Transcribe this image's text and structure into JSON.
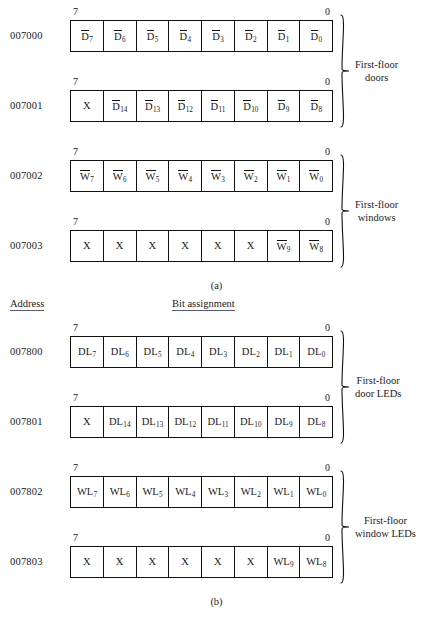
{
  "figures": [
    {
      "id": "a",
      "caption": "(a)",
      "headers": {
        "address": "Address",
        "bits": "Bit assignment"
      },
      "show_headers": false,
      "rows": [
        {
          "address": "007000",
          "msb": "7",
          "lsb": "0",
          "cells": [
            {
              "text": "D",
              "sub": "7",
              "overbar": true
            },
            {
              "text": "D",
              "sub": "6",
              "overbar": true
            },
            {
              "text": "D",
              "sub": "5",
              "overbar": true
            },
            {
              "text": "D",
              "sub": "4",
              "overbar": true
            },
            {
              "text": "D",
              "sub": "3",
              "overbar": true
            },
            {
              "text": "D",
              "sub": "2",
              "overbar": true
            },
            {
              "text": "D",
              "sub": "1",
              "overbar": true
            },
            {
              "text": "D",
              "sub": "0",
              "overbar": true
            }
          ]
        },
        {
          "address": "007001",
          "msb": "7",
          "lsb": "0",
          "cells": [
            {
              "text": "X",
              "sub": "",
              "overbar": false
            },
            {
              "text": "D",
              "sub": "14",
              "overbar": true
            },
            {
              "text": "D",
              "sub": "13",
              "overbar": true
            },
            {
              "text": "D",
              "sub": "12",
              "overbar": true
            },
            {
              "text": "D",
              "sub": "11",
              "overbar": true
            },
            {
              "text": "D",
              "sub": "10",
              "overbar": true
            },
            {
              "text": "D",
              "sub": "9",
              "overbar": true
            },
            {
              "text": "D",
              "sub": "8",
              "overbar": true
            }
          ]
        },
        {
          "address": "007002",
          "msb": "7",
          "lsb": "0",
          "cells": [
            {
              "text": "W",
              "sub": "7",
              "overbar": true
            },
            {
              "text": "W",
              "sub": "6",
              "overbar": true
            },
            {
              "text": "W",
              "sub": "5",
              "overbar": true
            },
            {
              "text": "W",
              "sub": "4",
              "overbar": true
            },
            {
              "text": "W",
              "sub": "3",
              "overbar": true
            },
            {
              "text": "W",
              "sub": "2",
              "overbar": true
            },
            {
              "text": "W",
              "sub": "1",
              "overbar": true
            },
            {
              "text": "W",
              "sub": "0",
              "overbar": true
            }
          ]
        },
        {
          "address": "007003",
          "msb": "7",
          "lsb": "0",
          "cells": [
            {
              "text": "X",
              "sub": "",
              "overbar": false
            },
            {
              "text": "X",
              "sub": "",
              "overbar": false
            },
            {
              "text": "X",
              "sub": "",
              "overbar": false
            },
            {
              "text": "X",
              "sub": "",
              "overbar": false
            },
            {
              "text": "X",
              "sub": "",
              "overbar": false
            },
            {
              "text": "X",
              "sub": "",
              "overbar": false
            },
            {
              "text": "W",
              "sub": "9",
              "overbar": true
            },
            {
              "text": "W",
              "sub": "8",
              "overbar": true
            }
          ]
        }
      ],
      "groups": [
        {
          "label": "First-floor\ndoors",
          "start_row": 0,
          "end_row": 1
        },
        {
          "label": "First-floor\nwindows",
          "start_row": 2,
          "end_row": 3
        }
      ]
    },
    {
      "id": "b",
      "caption": "(b)",
      "headers": {
        "address": "Address",
        "bits": "Bit assignment"
      },
      "show_headers": true,
      "rows": [
        {
          "address": "007800",
          "msb": "7",
          "lsb": "0",
          "cells": [
            {
              "text": "DL",
              "sub": "7",
              "overbar": false
            },
            {
              "text": "DL",
              "sub": "6",
              "overbar": false
            },
            {
              "text": "DL",
              "sub": "5",
              "overbar": false
            },
            {
              "text": "DL",
              "sub": "4",
              "overbar": false
            },
            {
              "text": "DL",
              "sub": "3",
              "overbar": false
            },
            {
              "text": "DL",
              "sub": "2",
              "overbar": false
            },
            {
              "text": "DL",
              "sub": "1",
              "overbar": false
            },
            {
              "text": "DL",
              "sub": "0",
              "overbar": false
            }
          ]
        },
        {
          "address": "007801",
          "msb": "7",
          "lsb": "0",
          "cells": [
            {
              "text": "X",
              "sub": "",
              "overbar": false
            },
            {
              "text": "DL",
              "sub": "14",
              "overbar": false
            },
            {
              "text": "DL",
              "sub": "13",
              "overbar": false
            },
            {
              "text": "DL",
              "sub": "12",
              "overbar": false
            },
            {
              "text": "DL",
              "sub": "11",
              "overbar": false
            },
            {
              "text": "DL",
              "sub": "10",
              "overbar": false
            },
            {
              "text": "DL",
              "sub": "9",
              "overbar": false
            },
            {
              "text": "DL",
              "sub": "8",
              "overbar": false
            }
          ]
        },
        {
          "address": "007802",
          "msb": "7",
          "lsb": "0",
          "cells": [
            {
              "text": "WL",
              "sub": "7",
              "overbar": false
            },
            {
              "text": "WL",
              "sub": "6",
              "overbar": false
            },
            {
              "text": "WL",
              "sub": "5",
              "overbar": false
            },
            {
              "text": "WL",
              "sub": "4",
              "overbar": false
            },
            {
              "text": "WL",
              "sub": "3",
              "overbar": false
            },
            {
              "text": "WL",
              "sub": "2",
              "overbar": false
            },
            {
              "text": "WL",
              "sub": "1",
              "overbar": false
            },
            {
              "text": "WL",
              "sub": "0",
              "overbar": false
            }
          ]
        },
        {
          "address": "007803",
          "msb": "7",
          "lsb": "0",
          "cells": [
            {
              "text": "X",
              "sub": "",
              "overbar": false
            },
            {
              "text": "X",
              "sub": "",
              "overbar": false
            },
            {
              "text": "X",
              "sub": "",
              "overbar": false
            },
            {
              "text": "X",
              "sub": "",
              "overbar": false
            },
            {
              "text": "X",
              "sub": "",
              "overbar": false
            },
            {
              "text": "X",
              "sub": "",
              "overbar": false
            },
            {
              "text": "WL",
              "sub": "9",
              "overbar": false
            },
            {
              "text": "WL",
              "sub": "8",
              "overbar": false
            }
          ]
        }
      ],
      "groups": [
        {
          "label": "First-floor\ndoor LEDs",
          "start_row": 0,
          "end_row": 1
        },
        {
          "label": "First-floor\nwindow LEDs",
          "start_row": 2,
          "end_row": 3
        }
      ]
    }
  ]
}
